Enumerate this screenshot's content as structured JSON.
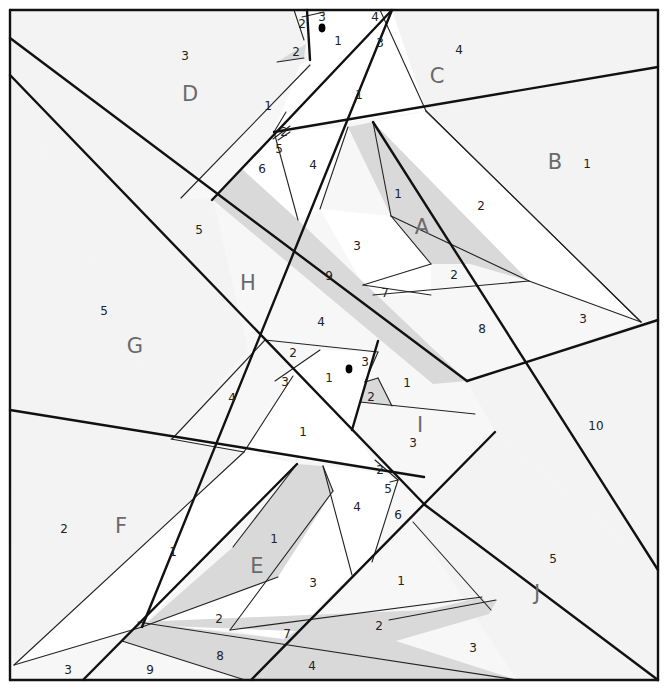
{
  "colors": {
    "background": "#f7f7f7",
    "white_piece": "#ffffff",
    "light_piece": "#f3f3f3",
    "shaded_piece": "#d9d9d9",
    "line": "#111111",
    "section_label": "#6a6a6a",
    "dot": "#000000"
  },
  "border": {
    "x": 10,
    "y": 10,
    "w": 648,
    "h": 670
  },
  "sections": [
    {
      "letter": "A",
      "x": 422,
      "y": 228
    },
    {
      "letter": "B",
      "x": 555,
      "y": 163
    },
    {
      "letter": "C",
      "x": 437,
      "y": 77
    },
    {
      "letter": "D",
      "x": 190,
      "y": 95
    },
    {
      "letter": "E",
      "x": 257,
      "y": 567
    },
    {
      "letter": "F",
      "x": 121,
      "y": 527
    },
    {
      "letter": "G",
      "x": 135,
      "y": 347
    },
    {
      "letter": "H",
      "x": 248,
      "y": 284
    },
    {
      "letter": "I",
      "x": 420,
      "y": 426
    },
    {
      "letter": "J",
      "x": 537,
      "y": 594
    }
  ],
  "piece_numbers": [
    {
      "n": "3",
      "x": 185,
      "y": 56
    },
    {
      "n": "2",
      "x": 296,
      "y": 52
    },
    {
      "n": "1",
      "x": 268,
      "y": 106
    },
    {
      "n": "2",
      "x": 302,
      "y": 24
    },
    {
      "n": "3",
      "x": 322,
      "y": 17
    },
    {
      "n": "1",
      "x": 338,
      "y": 41
    },
    {
      "n": "4",
      "x": 375,
      "y": 17
    },
    {
      "n": "3",
      "x": 380,
      "y": 43
    },
    {
      "n": "4",
      "x": 459,
      "y": 50
    },
    {
      "n": "1",
      "x": 359,
      "y": 95
    },
    {
      "n": "1",
      "x": 587,
      "y": 164
    },
    {
      "n": "2",
      "x": 284,
      "y": 132
    },
    {
      "n": "5",
      "x": 279,
      "y": 149
    },
    {
      "n": "6",
      "x": 262,
      "y": 169
    },
    {
      "n": "4",
      "x": 313,
      "y": 165
    },
    {
      "n": "1",
      "x": 398,
      "y": 194
    },
    {
      "n": "2",
      "x": 481,
      "y": 206
    },
    {
      "n": "3",
      "x": 357,
      "y": 246
    },
    {
      "n": "2",
      "x": 454,
      "y": 275
    },
    {
      "n": "9",
      "x": 329,
      "y": 276
    },
    {
      "n": "7",
      "x": 385,
      "y": 293
    },
    {
      "n": "8",
      "x": 482,
      "y": 329
    },
    {
      "n": "3",
      "x": 583,
      "y": 319
    },
    {
      "n": "5",
      "x": 199,
      "y": 230
    },
    {
      "n": "5",
      "x": 104,
      "y": 311
    },
    {
      "n": "4",
      "x": 321,
      "y": 322
    },
    {
      "n": "2",
      "x": 293,
      "y": 353
    },
    {
      "n": "3",
      "x": 285,
      "y": 382
    },
    {
      "n": "1",
      "x": 329,
      "y": 378
    },
    {
      "n": "3",
      "x": 365,
      "y": 362
    },
    {
      "n": "1",
      "x": 407,
      "y": 383
    },
    {
      "n": "2",
      "x": 371,
      "y": 397
    },
    {
      "n": "4",
      "x": 232,
      "y": 398
    },
    {
      "n": "1",
      "x": 303,
      "y": 432
    },
    {
      "n": "3",
      "x": 413,
      "y": 443
    },
    {
      "n": "10",
      "x": 596,
      "y": 426
    },
    {
      "n": "2",
      "x": 380,
      "y": 470
    },
    {
      "n": "5",
      "x": 388,
      "y": 489
    },
    {
      "n": "4",
      "x": 357,
      "y": 507
    },
    {
      "n": "6",
      "x": 398,
      "y": 515
    },
    {
      "n": "2",
      "x": 64,
      "y": 529
    },
    {
      "n": "1",
      "x": 173,
      "y": 552
    },
    {
      "n": "1",
      "x": 274,
      "y": 539
    },
    {
      "n": "3",
      "x": 313,
      "y": 583
    },
    {
      "n": "1",
      "x": 401,
      "y": 581
    },
    {
      "n": "5",
      "x": 553,
      "y": 559
    },
    {
      "n": "2",
      "x": 219,
      "y": 619
    },
    {
      "n": "7",
      "x": 287,
      "y": 634
    },
    {
      "n": "2",
      "x": 379,
      "y": 626
    },
    {
      "n": "3",
      "x": 473,
      "y": 648
    },
    {
      "n": "8",
      "x": 220,
      "y": 656
    },
    {
      "n": "4",
      "x": 312,
      "y": 666
    },
    {
      "n": "9",
      "x": 150,
      "y": 670
    },
    {
      "n": "3",
      "x": 68,
      "y": 670
    }
  ],
  "dots": [
    {
      "x": 322,
      "y": 28,
      "r": 4
    },
    {
      "x": 349,
      "y": 369,
      "r": 4
    }
  ],
  "shaded_polygons": [
    [
      [
        277,
        62
      ],
      [
        304,
        58
      ],
      [
        306,
        44
      ]
    ],
    [
      [
        213,
        200
      ],
      [
        242,
        169
      ],
      [
        298,
        220
      ],
      [
        467,
        381
      ],
      [
        433,
        384
      ]
    ],
    [
      [
        348,
        127
      ],
      [
        373,
        122
      ],
      [
        529,
        281
      ],
      [
        470,
        264
      ],
      [
        431,
        264
      ],
      [
        391,
        216
      ]
    ],
    [
      [
        365,
        382
      ],
      [
        378,
        378
      ],
      [
        392,
        406
      ],
      [
        360,
        402
      ]
    ],
    [
      [
        297,
        464
      ],
      [
        323,
        466
      ],
      [
        333,
        491
      ],
      [
        278,
        577
      ],
      [
        142,
        627
      ],
      [
        233,
        547
      ]
    ],
    [
      [
        138,
        622
      ],
      [
        428,
        610
      ],
      [
        482,
        597
      ],
      [
        491,
        610
      ],
      [
        372,
        634
      ],
      [
        140,
        625
      ]
    ],
    [
      [
        138,
        622
      ],
      [
        283,
        639
      ],
      [
        261,
        680
      ],
      [
        245,
        680
      ],
      [
        122,
        641
      ]
    ],
    [
      [
        283,
        639
      ],
      [
        303,
        627
      ],
      [
        497,
        600
      ],
      [
        489,
        614
      ],
      [
        396,
        641
      ],
      [
        517,
        680
      ],
      [
        261,
        680
      ]
    ]
  ],
  "light_polygons": [
    [
      [
        10,
        10
      ],
      [
        294,
        10
      ],
      [
        310,
        65
      ],
      [
        181,
        198
      ],
      [
        10,
        38
      ]
    ],
    [
      [
        310,
        65
      ],
      [
        307,
        10
      ],
      [
        392,
        10
      ],
      [
        426,
        111
      ],
      [
        392,
        10
      ]
    ],
    [
      [
        380,
        10
      ],
      [
        658,
        10
      ],
      [
        658,
        67
      ],
      [
        426,
        111
      ]
    ],
    [
      [
        426,
        111
      ],
      [
        658,
        67
      ],
      [
        658,
        320
      ],
      [
        641,
        322
      ]
    ],
    [
      [
        10,
        75
      ],
      [
        171,
        439
      ],
      [
        10,
        410
      ]
    ],
    [
      [
        10,
        410
      ],
      [
        244,
        452
      ],
      [
        14,
        665
      ]
    ],
    [
      [
        658,
        320
      ],
      [
        658,
        570
      ],
      [
        495,
        432
      ],
      [
        467,
        381
      ],
      [
        641,
        322
      ]
    ],
    [
      [
        495,
        432
      ],
      [
        658,
        570
      ],
      [
        658,
        680
      ],
      [
        517,
        680
      ],
      [
        413,
        522
      ]
    ],
    [
      [
        10,
        38
      ],
      [
        181,
        198
      ],
      [
        213,
        200
      ],
      [
        248,
        350
      ],
      [
        171,
        439
      ],
      [
        10,
        75
      ]
    ]
  ],
  "thick_lines": [
    [
      10,
      10,
      658,
      10
    ],
    [
      658,
      10,
      658,
      680
    ],
    [
      658,
      680,
      10,
      680
    ],
    [
      10,
      680,
      10,
      10
    ],
    [
      10,
      38,
      467,
      381
    ],
    [
      10,
      75,
      425,
      505
    ],
    [
      425,
      505,
      658,
      680
    ],
    [
      10,
      410,
      424,
      477
    ],
    [
      142,
      627,
      392,
      10
    ],
    [
      181,
      198,
      0,
      0
    ],
    [
      212,
      200,
      392,
      10
    ],
    [
      274,
      132,
      658,
      67
    ],
    [
      373,
      122,
      658,
      570
    ],
    [
      352,
      430,
      378,
      341
    ],
    [
      83,
      680,
      297,
      464
    ],
    [
      251,
      680,
      495,
      432
    ],
    [
      467,
      381,
      658,
      320
    ],
    [
      307,
      10,
      310,
      60
    ]
  ],
  "thin_lines": [
    [
      181,
      198,
      310,
      65
    ],
    [
      277,
      62,
      304,
      58
    ],
    [
      294,
      10,
      304,
      40
    ],
    [
      302,
      17,
      324,
      12
    ],
    [
      380,
      10,
      426,
      111
    ],
    [
      426,
      111,
      641,
      322
    ],
    [
      426,
      111,
      641,
      322
    ],
    [
      373,
      122,
      391,
      216
    ],
    [
      348,
      127,
      320,
      209
    ],
    [
      274,
      132,
      298,
      220
    ],
    [
      274,
      132,
      286,
      112
    ],
    [
      278,
      140,
      290,
      132
    ],
    [
      391,
      216,
      431,
      264
    ],
    [
      391,
      216,
      529,
      281
    ],
    [
      431,
      264,
      363,
      285
    ],
    [
      363,
      285,
      431,
      295
    ],
    [
      373,
      295,
      529,
      281
    ],
    [
      529,
      281,
      641,
      322
    ],
    [
      290,
      126,
      273,
      139
    ],
    [
      265,
      340,
      378,
      352
    ],
    [
      265,
      340,
      172,
      439
    ],
    [
      320,
      350,
      275,
      381
    ],
    [
      293,
      376,
      244,
      452
    ],
    [
      378,
      352,
      365,
      382
    ],
    [
      365,
      382,
      378,
      378
    ],
    [
      360,
      402,
      475,
      414
    ],
    [
      392,
      406,
      378,
      378
    ],
    [
      323,
      466,
      333,
      491
    ],
    [
      297,
      464,
      233,
      547
    ],
    [
      323,
      466,
      352,
      575
    ],
    [
      333,
      491,
      230,
      630
    ],
    [
      390,
      482,
      398,
      480
    ],
    [
      375,
      460,
      398,
      480
    ],
    [
      398,
      480,
      372,
      562
    ],
    [
      413,
      522,
      491,
      610
    ],
    [
      142,
      627,
      278,
      577
    ],
    [
      14,
      665,
      142,
      627
    ],
    [
      138,
      622,
      517,
      680
    ],
    [
      122,
      641,
      245,
      680
    ],
    [
      230,
      630,
      482,
      597
    ],
    [
      496,
      600,
      389,
      620
    ],
    [
      14,
      665,
      244,
      452
    ],
    [
      171,
      439,
      244,
      452
    ]
  ],
  "label_set": {
    "section_letters": [
      "A",
      "B",
      "C",
      "D",
      "E",
      "F",
      "G",
      "H",
      "I",
      "J"
    ]
  }
}
